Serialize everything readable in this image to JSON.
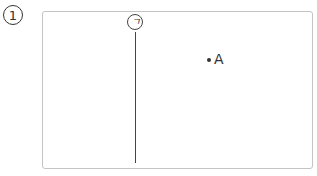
{
  "problem": {
    "number": "1"
  },
  "diagram": {
    "line": {
      "label": "ㄱ"
    },
    "point": {
      "label": "A"
    }
  }
}
